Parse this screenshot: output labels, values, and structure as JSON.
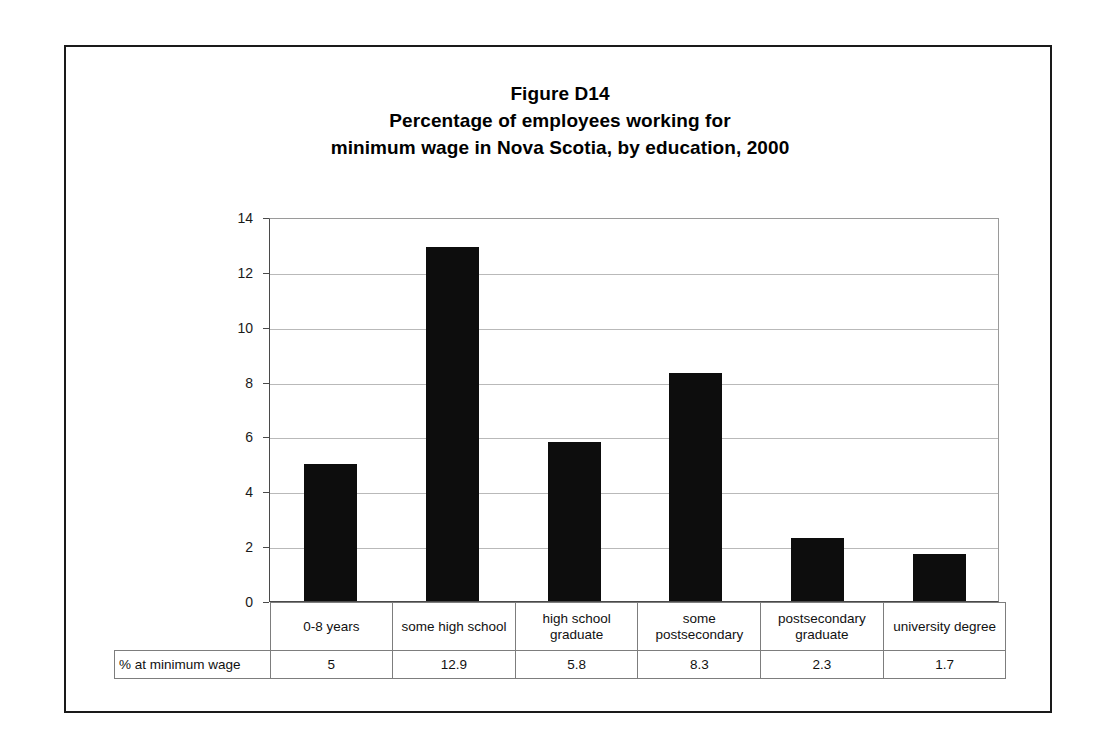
{
  "figure": {
    "title_lines": [
      "Figure D14",
      "Percentage of employees working for",
      "minimum wage in Nova Scotia, by education, 2000"
    ],
    "frame_color": "#1a1a1a"
  },
  "chart_data": {
    "type": "bar",
    "categories": [
      "0-8 years",
      "some high school",
      "high school graduate",
      "some postsecondary",
      "postsecondary graduate",
      "university degree"
    ],
    "category_lines": [
      [
        "0-8 years"
      ],
      [
        "some high school"
      ],
      [
        "high school",
        "graduate"
      ],
      [
        "some",
        "postsecondary"
      ],
      [
        "postsecondary",
        "graduate"
      ],
      [
        "university degree"
      ]
    ],
    "values": [
      5,
      12.9,
      5.8,
      8.3,
      2.3,
      1.7
    ],
    "value_labels": [
      "5",
      "12.9",
      "5.8",
      "8.3",
      "2.3",
      "1.7"
    ],
    "series_name": "% at minimum wage",
    "xlabel": "",
    "ylabel": "",
    "ylim": [
      0,
      14
    ],
    "yticks": [
      0,
      2,
      4,
      6,
      8,
      10,
      12,
      14
    ],
    "ytick_labels": [
      "0",
      "2",
      "4",
      "6",
      "8",
      "10",
      "12",
      "14"
    ],
    "grid": true,
    "legend": false,
    "bar_color": "#0d0d0d",
    "gridline_color": "#b9b9b9",
    "axis_color": "#4a4a4a"
  },
  "table": {
    "row_header": "% at minimum wage",
    "column_headers": [
      "0-8 years",
      "some high school",
      "high school graduate",
      "some postsecondary",
      "postsecondary graduate",
      "university degree"
    ],
    "values": [
      "5",
      "12.9",
      "5.8",
      "8.3",
      "2.3",
      "1.7"
    ]
  }
}
